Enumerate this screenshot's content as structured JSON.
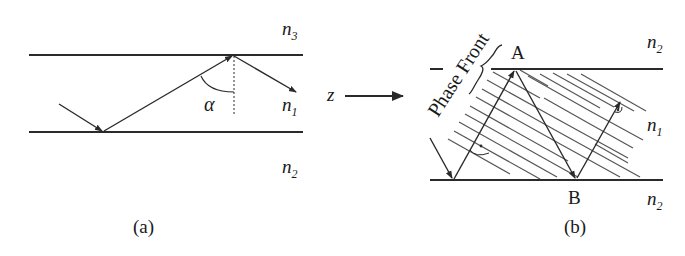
{
  "panel_a": {
    "caption": "(a)",
    "label_top": "n",
    "label_top_sub": "3",
    "label_core": "n",
    "label_core_sub": "1",
    "label_bottom": "n",
    "label_bottom_sub": "2",
    "angle_label": "α"
  },
  "panel_b": {
    "caption": "(b)",
    "label_top": "n",
    "label_top_sub": "2",
    "label_core": "n",
    "label_core_sub": "1",
    "label_bottom": "n",
    "label_bottom_sub": "2",
    "point_a": "A",
    "point_b": "B",
    "phase_front_label": "Phase Front"
  },
  "propagation": {
    "axis_label": "z"
  },
  "colors": {
    "line": "#2a2a2a",
    "hatch": "#555555",
    "background": "#ffffff"
  }
}
